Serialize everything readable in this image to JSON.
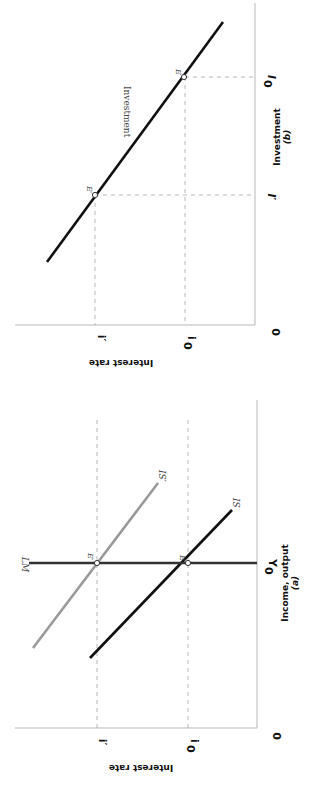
{
  "orientation": "rotated 90° clockwise (page printed sideways)",
  "panels": {
    "b": {
      "caption": "(b)",
      "x_axis_label": "Investment",
      "y_axis_label": "Interest rate",
      "origin_label": "0",
      "y_ticks": {
        "i0": "i",
        "i0_sub": "0",
        "i_prime": "i′"
      },
      "x_ticks": {
        "I0": "I",
        "I0_sub": "0",
        "I_prime": "I′"
      },
      "curve_label": "Investment",
      "points": {
        "E": "E",
        "E_prime": "E′"
      }
    },
    "a": {
      "caption": "(a)",
      "x_axis_label": "Income, output",
      "y_axis_label": "Interest rate",
      "origin_label": "0",
      "y_ticks": {
        "i0": "i",
        "i0_sub": "0",
        "i_prime": "i′"
      },
      "x_ticks": {
        "Y0": "Y",
        "Y0_sub": "0"
      },
      "curves": {
        "LM": "LM",
        "IS": "IS",
        "IS_prime": "IS′"
      },
      "points": {
        "E": "E",
        "E_prime": "E′"
      }
    }
  },
  "colors": {
    "IS": "#111111",
    "IS_prime": "#9a9a9a",
    "LM": "#333333",
    "axes": "#b8b8b8",
    "guides": "#b0b0b0"
  }
}
